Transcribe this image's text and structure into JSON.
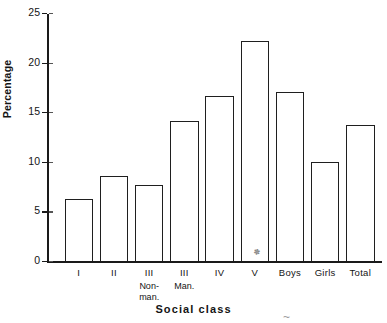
{
  "chart_data": {
    "type": "bar",
    "title": "",
    "xlabel": "Social class",
    "ylabel": "Percentage",
    "categories": [
      "I",
      "II",
      "III",
      "III",
      "IV",
      "V",
      "Boys",
      "Girls",
      "Total"
    ],
    "category_sublabels": [
      "",
      "",
      "Non-\nman.",
      "Man.",
      "",
      "",
      "",
      "",
      ""
    ],
    "values": [
      6.2,
      8.6,
      7.7,
      14.1,
      16.6,
      22.2,
      17.0,
      10.0,
      13.7
    ],
    "ylim": [
      0,
      25
    ],
    "ytick_labels": [
      "0",
      "5",
      "10",
      "15",
      "20",
      "25"
    ],
    "ytick_values": [
      0,
      5,
      10,
      15,
      20,
      25
    ],
    "grid": false,
    "legend": "none",
    "bar_style": {
      "fill": "#ffffff",
      "edge": "#1f1f1f"
    }
  },
  "axes": {
    "y_title": "Percentage",
    "x_title": "Social class"
  }
}
